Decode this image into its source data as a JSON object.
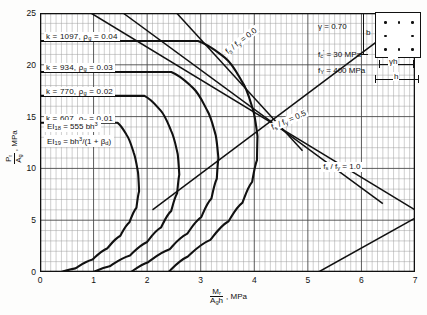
{
  "chart_data": {
    "type": "line",
    "title": "",
    "xlabel": "Mr / (Ag h), MPa",
    "ylabel": "Pr / Ag, MPa",
    "xlim": [
      0,
      7
    ],
    "ylim": [
      0,
      25
    ],
    "xticks": [
      0,
      1,
      2,
      3,
      4,
      5,
      6,
      7
    ],
    "yticks": [
      0,
      5,
      10,
      15,
      20,
      25
    ],
    "grid": "fine-rectangular",
    "legend_position": "top-right",
    "series": [
      {
        "name": "rho_g = 0.01",
        "k": 607,
        "rho_g": 0.01,
        "cap_value": 14.4,
        "points": [
          [
            0.0,
            14.4
          ],
          [
            0.9,
            14.4
          ],
          [
            1.45,
            14.4
          ],
          [
            1.62,
            13.2
          ],
          [
            1.75,
            11.5
          ],
          [
            1.83,
            9.6
          ],
          [
            1.85,
            7.8
          ],
          [
            1.8,
            6.2
          ],
          [
            1.67,
            4.8
          ],
          [
            1.5,
            3.5
          ],
          [
            1.26,
            2.3
          ],
          [
            0.98,
            1.2
          ],
          [
            0.66,
            0.35
          ],
          [
            0.4,
            0.0
          ]
        ]
      },
      {
        "name": "rho_g = 0.02",
        "k": 770,
        "rho_g": 0.02,
        "cap_value": 17.0,
        "points": [
          [
            0.0,
            17.0
          ],
          [
            1.3,
            17.0
          ],
          [
            1.95,
            17.0
          ],
          [
            2.25,
            15.6
          ],
          [
            2.45,
            13.6
          ],
          [
            2.57,
            11.4
          ],
          [
            2.6,
            9.4
          ],
          [
            2.56,
            7.6
          ],
          [
            2.45,
            5.9
          ],
          [
            2.26,
            4.3
          ],
          [
            2.0,
            2.9
          ],
          [
            1.68,
            1.6
          ],
          [
            1.3,
            0.55
          ],
          [
            1.0,
            0.0
          ]
        ]
      },
      {
        "name": "rho_g = 0.03",
        "k": 934,
        "rho_g": 0.03,
        "cap_value": 19.3,
        "points": [
          [
            0.0,
            19.3
          ],
          [
            1.7,
            19.3
          ],
          [
            2.45,
            19.3
          ],
          [
            2.85,
            17.8
          ],
          [
            3.12,
            15.6
          ],
          [
            3.28,
            13.2
          ],
          [
            3.33,
            11.0
          ],
          [
            3.3,
            9.0
          ],
          [
            3.2,
            7.1
          ],
          [
            3.01,
            5.3
          ],
          [
            2.75,
            3.7
          ],
          [
            2.42,
            2.2
          ],
          [
            2.02,
            0.95
          ],
          [
            1.7,
            0.0
          ]
        ]
      },
      {
        "name": "rho_g = 0.04",
        "k": 1097,
        "rho_g": 0.04,
        "cap_value": 22.3,
        "points": [
          [
            0.0,
            22.3
          ],
          [
            2.1,
            22.3
          ],
          [
            2.95,
            22.3
          ],
          [
            3.45,
            20.7
          ],
          [
            3.78,
            18.3
          ],
          [
            3.98,
            15.6
          ],
          [
            4.06,
            13.1
          ],
          [
            4.05,
            10.8
          ],
          [
            3.96,
            8.7
          ],
          [
            3.78,
            6.7
          ],
          [
            3.52,
            4.9
          ],
          [
            3.18,
            3.1
          ],
          [
            2.76,
            1.5
          ],
          [
            2.4,
            0.0
          ]
        ]
      }
    ],
    "reference_lines": [
      {
        "name": "fs/fy = 0.0",
        "label": "f_s / f_y = 0.0",
        "label_x": 3.45,
        "label_y": 21.0,
        "label_angle": -38,
        "points": [
          [
            2.55,
            25.0
          ],
          [
            4.9,
            11.7
          ]
        ]
      },
      {
        "name": "fs/fy = 0.5",
        "label": "f_s / f_y = 0.5",
        "label_x": 4.3,
        "label_y": 13.8,
        "label_angle": -24,
        "points": [
          [
            1.55,
            25.0
          ],
          [
            6.4,
            6.6
          ]
        ]
      },
      {
        "name": "fs/fy = 1.0",
        "label": "f_s / f_y = 1.0",
        "label_x": 5.25,
        "label_y": 10.1,
        "label_angle": 0,
        "points": [
          [
            0.95,
            25.0
          ],
          [
            7.0,
            6.0
          ]
        ]
      },
      {
        "name": "balanced-rising-line",
        "label": "",
        "points": [
          [
            2.1,
            6.0
          ],
          [
            7.0,
            25.0
          ]
        ]
      },
      {
        "name": "lower-right-line",
        "label": "",
        "points": [
          [
            5.2,
            0.0
          ],
          [
            7.0,
            5.2
          ]
        ]
      }
    ],
    "annotations": {
      "k_labels": [
        {
          "name": "k-label-004",
          "k_text": "k  =  1097,",
          "k_value": "1097",
          "rho_text": "ρg = 0.04",
          "y": 22.3
        },
        {
          "name": "k-label-003",
          "k_text": "k  =   934,",
          "k_value": "934",
          "rho_text": "ρg = 0.03",
          "y": 19.3
        },
        {
          "name": "k-label-002",
          "k_text": "k  =   770,",
          "k_value": "770",
          "rho_text": "ρg = 0.02",
          "y": 17.0
        },
        {
          "name": "k-label-001",
          "k_text": "k  =   607,",
          "k_value": "607",
          "rho_text": "ρg = 0.01",
          "y": 14.4
        }
      ],
      "ei_labels": [
        {
          "name": "ei-18",
          "text": "EI18 = 555 bh3",
          "x": 0.25,
          "y": 8.5
        },
        {
          "name": "ei-19",
          "text": "EI19 = bh3/(1 + βd)",
          "x": 0.25,
          "y": 7.1
        }
      ]
    }
  },
  "axes": {
    "y_label_num": "P",
    "y_label_num_sub": "r",
    "y_label_den": "A",
    "y_label_den_sub": "g",
    "y_label_units": ", MPa",
    "x_label_num": "M",
    "x_label_num_sub": "r",
    "x_label_den": "A",
    "x_label_den_sub": "g",
    "x_label_den_tail": "h",
    "x_label_units": ", MPa",
    "yticks": [
      "25",
      "20",
      "15",
      "10",
      "5",
      "0"
    ],
    "xticks": [
      "0",
      "1",
      "2",
      "3",
      "4",
      "5",
      "6",
      "7"
    ]
  },
  "k_annotations": [
    {
      "k_eq": "k  =  1097,",
      "rho": "ρ",
      "rho_sub": "g",
      "rho_eq": "= 0.04"
    },
    {
      "k_eq": "k  =   934,",
      "rho": "ρ",
      "rho_sub": "g",
      "rho_eq": "= 0.03"
    },
    {
      "k_eq": "k  =   770,",
      "rho": "ρ",
      "rho_sub": "g",
      "rho_eq": "= 0.02"
    },
    {
      "k_eq": "k  =   607,",
      "rho": "ρ",
      "rho_sub": "g",
      "rho_eq": "= 0.01"
    }
  ],
  "ei_annotations": {
    "ei18_lhs": "EI",
    "ei18_sub": "18",
    "ei18_rhs": "=  555 bh",
    "ei18_sup": "3",
    "ei19_lhs": "EI",
    "ei19_sub": "19",
    "ei19_rhs": "=  bh",
    "ei19_sup": "3",
    "ei19_tail": "/(1 + ",
    "ei19_beta": "β",
    "ei19_beta_sub": "d",
    "ei19_close": ")"
  },
  "curve_labels": [
    {
      "name": "fs-fy-0-0",
      "lhs": "f",
      "lhs_sub": "s",
      "slash": "/ f",
      "rhs_sub": "y",
      "eq": "= 0.0"
    },
    {
      "name": "fs-fy-0-5",
      "lhs": "f",
      "lhs_sub": "s",
      "slash": "/ f",
      "rhs_sub": "y",
      "eq": "= 0.5"
    },
    {
      "name": "fs-fy-1-0",
      "lhs": "f",
      "lhs_sub": "s",
      "slash": "/ f",
      "rhs_sub": "y",
      "eq": "= 1.0"
    }
  ],
  "legend": {
    "gamma_symbol": "γ",
    "gamma_eq": "=  0.70",
    "fc_symbol": "f",
    "fc_sub": "c",
    "fc_prime": "'",
    "fc_eq": "=   30  MPa",
    "fy_symbol": "f",
    "fy_sub": "Y",
    "fy_eq": "=  400  MPa",
    "dim_b": "b",
    "dim_h": "h",
    "dim_gamma_h": "γh",
    "bar_count": 8
  },
  "colors": {
    "curve": "#111111",
    "grid_minor": "#9a9a9a",
    "grid_major": "#4a4a4a",
    "axis": "#111111",
    "background": "#fdfdfc"
  }
}
